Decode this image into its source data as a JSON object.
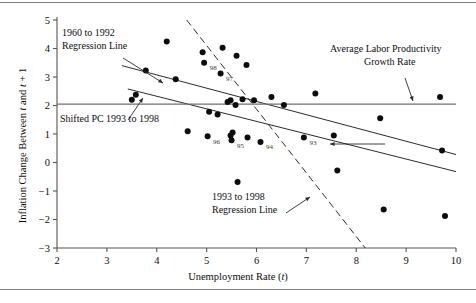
{
  "chart_data": {
    "type": "scatter",
    "title": "",
    "xlabel": "Unemployment Rate (t)",
    "ylabel": "Inflation Change Between t and t + 1",
    "xlim": [
      2,
      10
    ],
    "ylim": [
      -3,
      5
    ],
    "xticks": [
      2,
      3,
      4,
      5,
      6,
      7,
      8,
      9,
      10
    ],
    "yticks": [
      5,
      4,
      3,
      2,
      1,
      0,
      -1,
      -2,
      -3
    ],
    "ytick_labels": [
      "5",
      "4",
      "3",
      "2",
      "1",
      "0",
      "−1",
      "−2",
      "−3"
    ],
    "grid": false,
    "legend_position": "none",
    "points": [
      {
        "x": 3.5,
        "y": 2.2
      },
      {
        "x": 3.58,
        "y": 2.38
      },
      {
        "x": 3.78,
        "y": 3.23
      },
      {
        "x": 4.2,
        "y": 4.25
      },
      {
        "x": 4.38,
        "y": 2.92
      },
      {
        "x": 4.92,
        "y": 3.87
      },
      {
        "x": 4.95,
        "y": 3.5,
        "label": "98"
      },
      {
        "x": 5.32,
        "y": 4.03
      },
      {
        "x": 5.28,
        "y": 3.12,
        "label": "97"
      },
      {
        "x": 5.6,
        "y": 3.75
      },
      {
        "x": 5.8,
        "y": 3.42
      },
      {
        "x": 5.42,
        "y": 2.12
      },
      {
        "x": 5.48,
        "y": 2.18
      },
      {
        "x": 5.58,
        "y": 2.02
      },
      {
        "x": 5.72,
        "y": 2.22
      },
      {
        "x": 5.95,
        "y": 2.18
      },
      {
        "x": 5.05,
        "y": 1.78
      },
      {
        "x": 5.22,
        "y": 1.68
      },
      {
        "x": 4.62,
        "y": 1.1
      },
      {
        "x": 5.02,
        "y": 0.92,
        "label": "96"
      },
      {
        "x": 5.48,
        "y": 0.95
      },
      {
        "x": 5.5,
        "y": 0.78,
        "label": "95"
      },
      {
        "x": 5.52,
        "y": 1.05
      },
      {
        "x": 5.82,
        "y": 0.88
      },
      {
        "x": 6.08,
        "y": 0.72,
        "label": "94"
      },
      {
        "x": 5.62,
        "y": -0.68
      },
      {
        "x": 6.3,
        "y": 2.3
      },
      {
        "x": 6.55,
        "y": 2.02
      },
      {
        "x": 6.95,
        "y": 0.88,
        "label": "93"
      },
      {
        "x": 7.18,
        "y": 2.42
      },
      {
        "x": 7.55,
        "y": 0.95
      },
      {
        "x": 7.62,
        "y": -0.28
      },
      {
        "x": 8.48,
        "y": 1.55
      },
      {
        "x": 8.55,
        "y": -1.65
      },
      {
        "x": 9.68,
        "y": 2.3
      },
      {
        "x": 9.72,
        "y": 0.42
      },
      {
        "x": 9.78,
        "y": -1.88
      }
    ],
    "lines": [
      {
        "name": "1960 to 1992 Regression Line",
        "style": "solid",
        "x1": 3.3,
        "y1": 3.4,
        "x2": 10.0,
        "y2": 0.28
      },
      {
        "name": "Shifted PC 1993 to 1998",
        "style": "solid",
        "x1": 3.42,
        "y1": 2.58,
        "x2": 10.0,
        "y2": -0.32
      },
      {
        "name": "1993 to 1998 Regression Line",
        "style": "dashed",
        "x1": 4.6,
        "y1": 5.0,
        "x2": 8.18,
        "y2": -3.0
      },
      {
        "name": "Average Labor Productivity Growth Rate",
        "style": "solid-horizontal",
        "x1": 2.0,
        "y1": 2.05,
        "x2": 10.0,
        "y2": 2.05
      }
    ],
    "annotations": [
      {
        "name": "regression-1960-1992",
        "text_line1": "1960 to 1992",
        "text_line2": "Regression Line",
        "text_x": 62,
        "text_y": 36,
        "arrow": {
          "x1": 123,
          "y1": 58,
          "x2": 163,
          "y2": 83
        }
      },
      {
        "name": "shifted-pc-1993-1998",
        "text_line1": "Shifted PC 1993 to 1998",
        "text_line2": "",
        "text_x": 60,
        "text_y": 122,
        "arrow": {
          "x1": 128,
          "y1": 120,
          "x2": 143,
          "y2": 98
        }
      },
      {
        "name": "regression-1993-1998",
        "text_line1": "1993 to 1998",
        "text_line2": "Regression Line",
        "text_x": 212,
        "text_y": 200,
        "arrow": {
          "x1": 286,
          "y1": 213,
          "x2": 310,
          "y2": 197
        }
      },
      {
        "name": "average-labor-productivity",
        "text_line1": "Average Labor Productivity",
        "text_line2": "Growth Rate",
        "text_x": 330,
        "text_y": 52,
        "arrow": {
          "x1": 405,
          "y1": 78,
          "x2": 413,
          "y2": 101
        }
      },
      {
        "name": "shifted-pc-pointer",
        "text_line1": "",
        "text_line2": "",
        "text_x": 0,
        "text_y": 0,
        "arrow": {
          "x1": 385,
          "y1": 144,
          "x2": 330,
          "y2": 144
        }
      }
    ],
    "colors": {
      "point": "#0d0d0d",
      "line": "#2b2b2b",
      "axis": "#555555",
      "rule": "#7d7d7d",
      "text": "#0d0d0d"
    }
  }
}
